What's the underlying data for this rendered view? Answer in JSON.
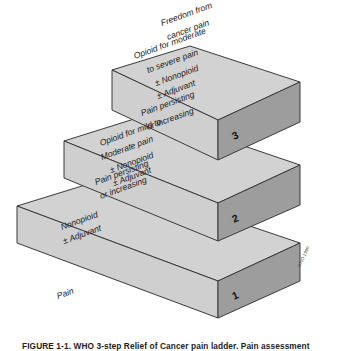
{
  "figure": {
    "credit": "WHO 1990",
    "baseline_label": "Pain",
    "caption": "FIGURE 1-1. WHO 3-step Relief of Cancer pain ladder. Pain assessment"
  },
  "steps": [
    {
      "number": "1",
      "front_lines": [
        "Nonopioid",
        "± Adjuvant"
      ],
      "top_lines": [
        "Pain persisting",
        "or increasing"
      ]
    },
    {
      "number": "2",
      "front_lines": [
        "Opioid for mild to",
        "Moderate pain",
        "± Nonopioid",
        "± Adjuvant"
      ],
      "top_lines": [
        "Pain persisting",
        "or increasing"
      ]
    },
    {
      "number": "3",
      "front_lines": [
        "Opioid for moderate",
        "to severe pain",
        "± Nonopioid",
        "± Adjuvant"
      ],
      "top_lines": [
        "Freedom from",
        "cancer pain"
      ]
    }
  ],
  "colors": {
    "top_face": "#d2d2d2",
    "front_face": "#cfcfcf",
    "side_face": "#9d9d9d",
    "outline": "#3a3a3a"
  }
}
